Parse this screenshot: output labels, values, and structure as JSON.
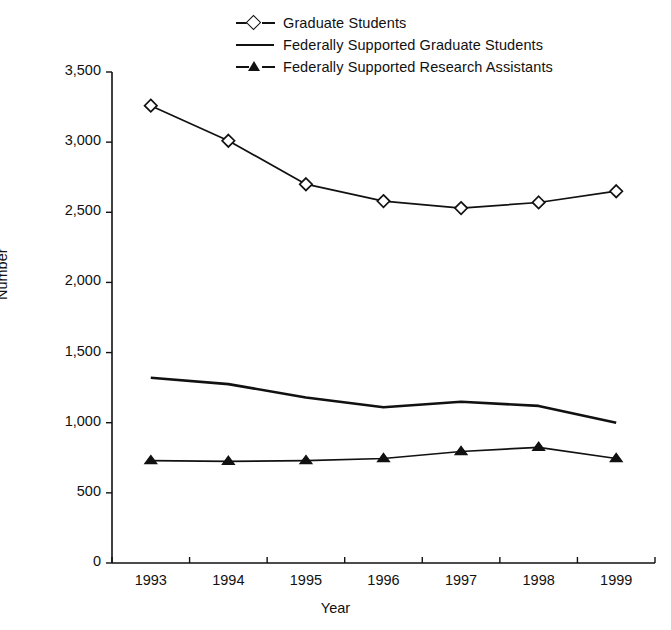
{
  "chart_data": {
    "type": "line",
    "title": "",
    "xlabel": "Year",
    "ylabel": "Number",
    "x": [
      "1993",
      "1994",
      "1995",
      "1996",
      "1997",
      "1998",
      "1999"
    ],
    "categories": [
      "1993",
      "1994",
      "1995",
      "1996",
      "1997",
      "1998",
      "1999"
    ],
    "ylim": [
      0,
      3500
    ],
    "ytick_labels": [
      "3,500",
      "3,000",
      "2,500",
      "2,000",
      "1,500",
      "1,000",
      "500",
      "0"
    ],
    "ytick_values": [
      3500,
      3000,
      2500,
      2000,
      1500,
      1000,
      500,
      0
    ],
    "grid": false,
    "legend_position": "top-center",
    "series": [
      {
        "name": "Graduate Students",
        "marker": "open-diamond",
        "values": [
          3260,
          3010,
          2700,
          2580,
          2530,
          2570,
          2650
        ]
      },
      {
        "name": "Federally Supported Graduate Students",
        "marker": "none",
        "values": [
          1320,
          1275,
          1180,
          1110,
          1150,
          1120,
          1000
        ]
      },
      {
        "name": "Federally Supported Research Assistants",
        "marker": "filled-triangle",
        "values": [
          730,
          725,
          730,
          745,
          795,
          825,
          745
        ]
      }
    ]
  },
  "legend": {
    "items": [
      {
        "label": "Graduate Students",
        "marker": "open-diamond"
      },
      {
        "label": "Federally Supported Graduate Students",
        "marker": "line"
      },
      {
        "label": "Federally Supported Research Assistants",
        "marker": "filled-triangle"
      }
    ]
  },
  "axes": {
    "x_title": "Year",
    "y_title": "Number"
  },
  "colors": {
    "line": "#111111",
    "marker_fill": "#ffffff",
    "background": "#ffffff"
  }
}
